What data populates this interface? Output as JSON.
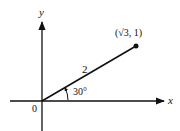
{
  "diagram": {
    "axes": {
      "x_label": "x",
      "y_label": "y",
      "origin_label": "0"
    },
    "vector": {
      "length_label": "2",
      "angle_label": "30°",
      "endpoint_label": "(√3, 1)"
    },
    "colors": {
      "stroke": "#111111",
      "background": "#ffffff"
    }
  }
}
